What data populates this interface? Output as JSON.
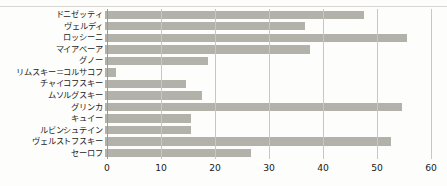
{
  "chart_data": {
    "type": "bar",
    "orientation": "horizontal",
    "title": "",
    "subtitle": "",
    "xlabel": "",
    "ylabel": "",
    "xlim": [
      0,
      60
    ],
    "ylim": null,
    "grid": true,
    "legend": null,
    "legend_position": "none",
    "xticks": [
      0,
      10,
      20,
      30,
      40,
      50,
      60
    ],
    "xtick_labels": [
      "0",
      "10",
      "20",
      "30",
      "40",
      "50",
      "60"
    ],
    "bar_color": "#b2b2ab",
    "gridline_color": "#c9c7c0",
    "axis_color": "#9c9a93",
    "text_color": "#1b1b1b",
    "background_color": "#fdfdfb",
    "categories": [
      "ドニゼッティ",
      "ヴェルディ",
      "ロッシーニ",
      "マイアベーア",
      "グノー",
      "リムスキー＝コルサコフ",
      "チャイコフスキー",
      "ムソルグスキー",
      "グリンカ",
      "キュイー",
      "ルビンシュテイン",
      "ヴェルストフスキー",
      "セーロフ"
    ],
    "values": [
      48,
      37,
      56,
      38,
      19,
      2,
      15,
      18,
      55,
      16,
      16,
      53,
      27
    ]
  }
}
